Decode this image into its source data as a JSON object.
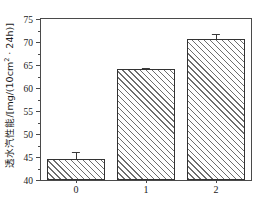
{
  "chart_data": {
    "type": "bar",
    "title": "",
    "xlabel": "",
    "ylabel": "透水汽性能/[mg/(10cm2 · 24h)]",
    "ylabel_main": "透水汽性能/[mg/(10cm",
    "ylabel_sup": "2",
    "ylabel_tail": " · 24h)]",
    "categories": [
      "0",
      "1",
      "2"
    ],
    "values": [
      44.5,
      64.2,
      70.6
    ],
    "errors": [
      1.5,
      0.25,
      1.2
    ],
    "ylim": [
      40,
      75
    ],
    "yticks": [
      40,
      45,
      50,
      55,
      60,
      65,
      70,
      75
    ],
    "ytick_labels": [
      "40",
      "45",
      "50",
      "55",
      "60",
      "65",
      "70",
      "75"
    ],
    "xtick_labels": [
      "0",
      "1",
      "2"
    ],
    "grid": false,
    "legend": null,
    "bar_fill": "hatch-45",
    "bar_edge_color": "#333333",
    "hatch_color": "#6e6e6e",
    "background": "#ffffff",
    "axis_color": "#4a4a4a"
  }
}
